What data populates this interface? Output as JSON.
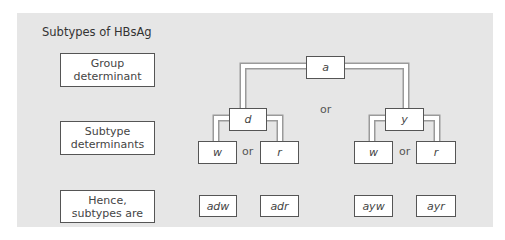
{
  "title": "Subtypes of HBsAg",
  "row_labels": {
    "group": "Group\ndeterminant",
    "subtype": "Subtype\ndeterminants",
    "hence": "Hence,\nsubtypes are"
  },
  "tree": {
    "root": "a",
    "or_top": "or",
    "left_branch": {
      "node": "d",
      "children": [
        "w",
        "r"
      ],
      "or": "or"
    },
    "right_branch": {
      "node": "y",
      "children": [
        "w",
        "r"
      ],
      "or": "or"
    }
  },
  "subtypes": [
    "adw",
    "adr",
    "ayw",
    "ayr"
  ],
  "colors": {
    "panel": "#e6e6e6",
    "box": "#ffffff",
    "border": "#555555",
    "connector_outline": "#9a9a9a"
  }
}
